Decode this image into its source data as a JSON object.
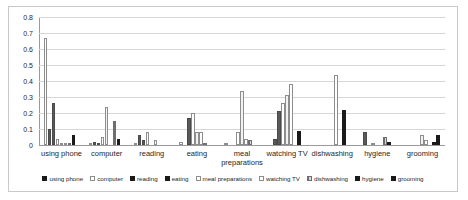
{
  "chart_data": {
    "type": "bar",
    "title": "",
    "subtitle": "",
    "xlabel": "",
    "ylabel": "",
    "ylim": [
      0,
      0.8
    ],
    "grid": true,
    "legend_position": "bottom",
    "y_ticks": [
      "0",
      "0.1",
      "0.2",
      "0.3",
      "0.4",
      "0.5",
      "0.6",
      "0.7",
      "0.8"
    ],
    "y_tick_values": [
      0,
      0.1,
      0.2,
      0.3,
      0.4,
      0.5,
      0.6,
      0.7,
      0.8
    ],
    "categories": [
      "using phone",
      "computer",
      "reading",
      "eating",
      "meal preparations",
      "watching TV",
      "dishwashing",
      "hygiene",
      "grooming"
    ],
    "series": [
      {
        "name": "using phone",
        "style": "white",
        "color": "#ffffff",
        "values": [
          0.67,
          0.01,
          0.01,
          0.02,
          0.01,
          0.0,
          0.0,
          0.0,
          0.0
        ]
      },
      {
        "name": "computer",
        "style": "dkgray",
        "color": "#595959",
        "values": [
          0.1,
          0.02,
          0.06,
          0.0,
          0.0,
          0.04,
          0.0,
          0.08,
          0.0
        ]
      },
      {
        "name": "reading",
        "style": "dkgray2",
        "color": "#595959",
        "values": [
          0.26,
          0.01,
          0.03,
          0.17,
          0.0,
          0.21,
          0.0,
          0.0,
          0.0
        ]
      },
      {
        "name": "eating",
        "style": "white",
        "color": "#ffffff",
        "values": [
          0.04,
          0.05,
          0.08,
          0.2,
          0.08,
          0.26,
          0.0,
          0.01,
          0.0
        ]
      },
      {
        "name": "meal preparations",
        "style": "ltgray",
        "color": "#f2f2f2",
        "values": [
          0.01,
          0.24,
          0.0,
          0.08,
          0.34,
          0.31,
          0.0,
          0.0,
          0.06
        ]
      },
      {
        "name": "watching TV",
        "style": "white",
        "color": "#ffffff",
        "values": [
          0.01,
          0.0,
          0.03,
          0.08,
          0.04,
          0.38,
          0.44,
          0.0,
          0.03
        ]
      },
      {
        "name": "dishwashing",
        "style": "hatch",
        "color": "#d9d9d9",
        "values": [
          0.01,
          0.15,
          0.0,
          0.01,
          0.03,
          0.0,
          0.0,
          0.05,
          0.0
        ]
      },
      {
        "name": "hygiene",
        "style": "black",
        "color": "#1a1a1a",
        "values": [
          0.06,
          0.04,
          0.0,
          0.0,
          0.0,
          0.09,
          0.22,
          0.02,
          0.02
        ]
      },
      {
        "name": "grooming",
        "style": "black2",
        "color": "#1a1a1a",
        "values": [
          0.0,
          0.0,
          0.0,
          0.0,
          0.0,
          0.0,
          0.0,
          0.0,
          0.06
        ]
      }
    ]
  },
  "legend": {
    "items": [
      {
        "label": "using phone",
        "swatch": "sw-black"
      },
      {
        "label": "computer",
        "swatch": "sw-white"
      },
      {
        "label": "reading",
        "swatch": "sw-black"
      },
      {
        "label": "eating",
        "swatch": "sw-black"
      },
      {
        "label": "meal preparations",
        "swatch": "sw-white"
      },
      {
        "label": "watching TV",
        "swatch": "sw-white"
      },
      {
        "label": "dishwashing",
        "swatch": "sw-hatch"
      },
      {
        "label": "hygiene",
        "swatch": "sw-black"
      },
      {
        "label": "grooming",
        "swatch": "sw-black"
      }
    ]
  },
  "colors": {
    "grid": "#d6d6d6",
    "axis": "#9a9a9a",
    "text": "#262626",
    "frame": "#c9c9c9",
    "background": "#ffffff"
  }
}
